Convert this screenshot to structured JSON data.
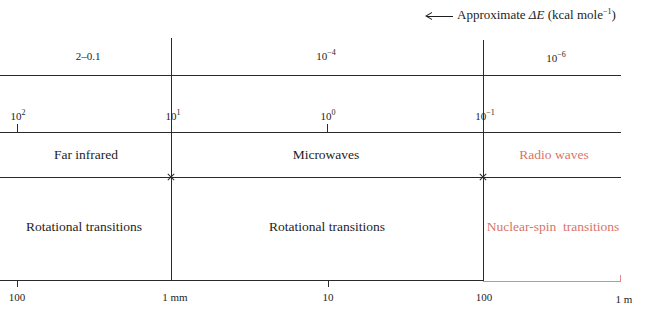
{
  "header": {
    "arrow_icon": "left-arrow-icon",
    "title_prefix": "Approximate ",
    "title_symbol": "ΔE",
    "title_unit_open": " (kcal mole",
    "title_unit_exp": "−1",
    "title_unit_close": ")"
  },
  "energy_row": [
    {
      "base": "2–0.1",
      "exp": ""
    },
    {
      "base": "10",
      "exp": "−4"
    },
    {
      "base": "10",
      "exp": "−6"
    }
  ],
  "wavenumber_row": [
    {
      "base": "10",
      "exp": "2"
    },
    {
      "base": "10",
      "exp": "1"
    },
    {
      "base": "10",
      "exp": "0"
    },
    {
      "base": "10",
      "exp": "−1"
    }
  ],
  "bands": [
    {
      "label": "Far infrared",
      "color": "#1e1e1e"
    },
    {
      "label": "Microwaves",
      "color": "#1e1e1e"
    },
    {
      "label": "Radio waves",
      "color": "#d97468"
    }
  ],
  "transitions": [
    {
      "label": "Rotational transitions",
      "color": "#1e1e1e"
    },
    {
      "label": "Rotational transitions",
      "color": "#1e1e1e"
    },
    {
      "label": "Nuclear-spin  transitions",
      "color": "#d97468"
    }
  ],
  "wavelength_axis": [
    {
      "label": "100"
    },
    {
      "label": "1 mm"
    },
    {
      "label": "10"
    },
    {
      "label": "100"
    },
    {
      "label": "1 m"
    }
  ],
  "colors": {
    "line": "#2a2a2a",
    "accent_red": "#d97468",
    "accent_red_line": "#e08a82"
  }
}
